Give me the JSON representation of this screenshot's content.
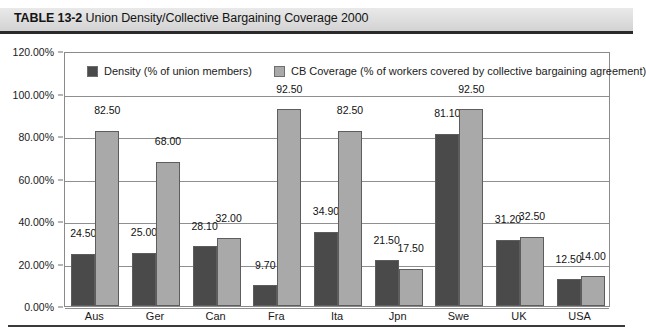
{
  "header": {
    "table_label": "TABLE 13-2",
    "title": "Union Density/Collective Bargaining Coverage 2000"
  },
  "colors": {
    "density_bar": "#4a4a4a",
    "coverage_bar": "#a9a9a9",
    "bar_outline": "#5d5d5d",
    "gridline": "#8f8f8f",
    "header_background": "#dcdcdc",
    "header_rule": "#2a2a2a",
    "text": "#1a1a1a"
  },
  "chart_data": {
    "type": "bar",
    "title": "Union Density/Collective Bargaining Coverage 2000",
    "xlabel": "",
    "ylabel": "",
    "ylim": [
      0,
      120
    ],
    "ytick_labels": [
      "0.00%",
      "20.00%",
      "40.00%",
      "60.00%",
      "80.00%",
      "100.00%",
      "120.00%"
    ],
    "ytick_values": [
      0,
      20,
      40,
      60,
      80,
      100,
      120
    ],
    "grid": true,
    "legend_position": "top-left-inside",
    "categories": [
      "Aus",
      "Ger",
      "Can",
      "Fra",
      "Ita",
      "Jpn",
      "Swe",
      "UK",
      "USA"
    ],
    "series": [
      {
        "name": "Density (% of union members)",
        "color": "#4a4a4a",
        "values": [
          24.5,
          25.0,
          28.1,
          9.7,
          34.9,
          21.5,
          81.1,
          31.2,
          12.5
        ],
        "labels": [
          "24.50",
          "25.00",
          "28.10",
          "9.70",
          "34.90",
          "21.50",
          "81.10",
          "31.20",
          "12.50"
        ]
      },
      {
        "name": "CB Coverage (% of workers covered by collective bargaining agreement)",
        "color": "#a9a9a9",
        "values": [
          82.5,
          68.0,
          32.0,
          92.5,
          82.5,
          17.5,
          92.5,
          32.5,
          14.0
        ],
        "labels": [
          "82.50",
          "68.00",
          "32.00",
          "92.50",
          "82.50",
          "17.50",
          "92.50",
          "32.50",
          "14.00"
        ]
      }
    ]
  }
}
